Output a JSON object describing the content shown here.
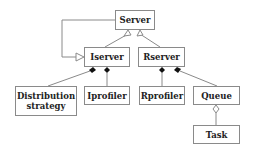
{
  "diagram": {
    "type": "uml-class-diagram",
    "nodes": [
      {
        "id": "server",
        "label": "Server"
      },
      {
        "id": "iserver",
        "label": "Iserver"
      },
      {
        "id": "rserver",
        "label": "Rserver"
      },
      {
        "id": "distribution",
        "label": "Distribution strategy"
      },
      {
        "id": "iprofiler",
        "label": "Iprofiler"
      },
      {
        "id": "rprofiler",
        "label": "Rprofiler"
      },
      {
        "id": "queue",
        "label": "Queue"
      },
      {
        "id": "task",
        "label": "Task"
      }
    ],
    "edges": [
      {
        "from": "iserver",
        "to": "server",
        "kind": "generalization"
      },
      {
        "from": "rserver",
        "to": "server",
        "kind": "generalization"
      },
      {
        "from": "server",
        "to": "iserver",
        "kind": "association-arrow"
      },
      {
        "from": "iserver",
        "to": "distribution",
        "kind": "composition"
      },
      {
        "from": "iserver",
        "to": "iprofiler",
        "kind": "composition"
      },
      {
        "from": "rserver",
        "to": "rprofiler",
        "kind": "composition"
      },
      {
        "from": "rserver",
        "to": "queue",
        "kind": "composition"
      },
      {
        "from": "queue",
        "to": "task",
        "kind": "aggregation"
      }
    ]
  }
}
